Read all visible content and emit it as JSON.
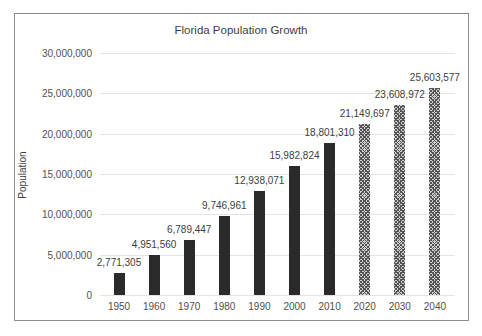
{
  "chart_data": {
    "type": "bar",
    "title": "Florida Population Growth",
    "xlabel": "",
    "ylabel": "Population",
    "ylim": [
      0,
      30000000
    ],
    "yticks": [
      "0",
      "5,000,000",
      "10,000,000",
      "15,000,000",
      "20,000,000",
      "25,000,000",
      "30,000,000"
    ],
    "grid": true,
    "legend": "none",
    "categories": [
      "1950",
      "1960",
      "1970",
      "1980",
      "1990",
      "2000",
      "2010",
      "2020",
      "2030",
      "2040"
    ],
    "values": [
      2771305,
      4951560,
      6789447,
      9746961,
      12938071,
      15982824,
      18801310,
      21149697,
      23608972,
      25603577
    ],
    "labels": [
      "2,771,305",
      "4,951,560",
      "6,789,447",
      "9,746,961",
      "12,938,071",
      "15,982,824",
      "18,801,310",
      "21,149,697",
      "23,608,972",
      "25,603,577"
    ],
    "styles": [
      "solid",
      "solid",
      "solid",
      "solid",
      "solid",
      "solid",
      "solid",
      "hatched",
      "hatched",
      "hatched"
    ],
    "annotations": "Bars for 2020–2040 are hatched (projected values)"
  }
}
